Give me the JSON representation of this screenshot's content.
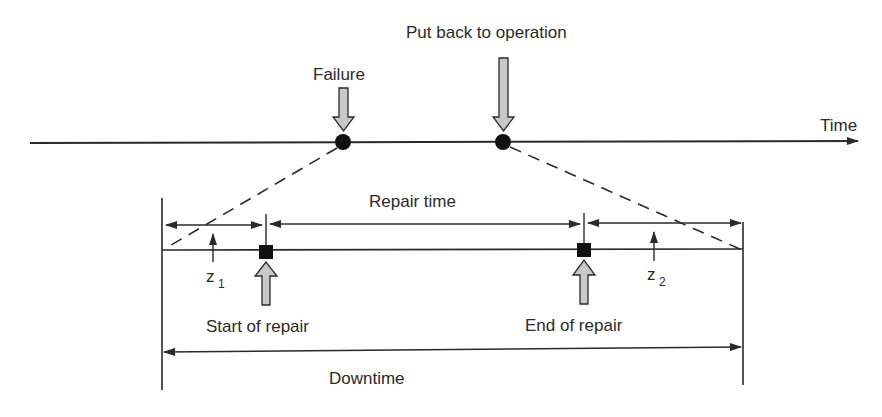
{
  "diagram": {
    "type": "timeline-downtime",
    "labels": {
      "time_axis": "Time",
      "failure": "Failure",
      "put_back": "Put back to operation",
      "repair_time": "Repair time",
      "z1": "z",
      "z1_sub": "1",
      "z2": "z",
      "z2_sub": "2",
      "start_of_repair": "Start of repair",
      "end_of_repair": "End of repair",
      "downtime": "Downtime"
    },
    "colors": {
      "line": "#2a2a2a",
      "arrow_fill": "#c8c8c8",
      "marker": "#111111"
    },
    "events": [
      {
        "name": "failure",
        "position": "x=343"
      },
      {
        "name": "put_back_to_operation",
        "position": "x=503"
      }
    ],
    "intervals": [
      {
        "name": "z1",
        "from": "failure",
        "to": "start_of_repair"
      },
      {
        "name": "repair_time",
        "from": "start_of_repair",
        "to": "end_of_repair"
      },
      {
        "name": "z2",
        "from": "end_of_repair",
        "to": "put_back_to_operation"
      },
      {
        "name": "downtime",
        "from": "failure",
        "to": "put_back_to_operation"
      }
    ]
  }
}
